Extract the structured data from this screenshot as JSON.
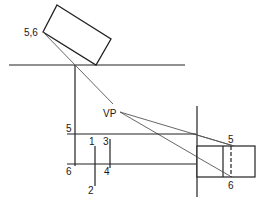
{
  "diagram": {
    "title": "",
    "colors": {
      "line": "#222222",
      "projector": "#555555",
      "background": "#ffffff"
    },
    "labels": {
      "plan_corner": "5,6",
      "vanishing_point": "VP",
      "line5_left": "5",
      "line6_left": "6",
      "mark1": "1",
      "mark2": "2",
      "mark3": "3",
      "mark4": "4",
      "elev5": "5",
      "elev6": "6"
    }
  }
}
